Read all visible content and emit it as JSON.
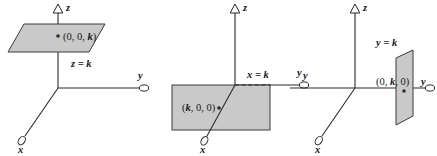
{
  "figure": {
    "background_color": "#ffffff",
    "plane_fill_color": "#c9c9c9",
    "line_color": "#2b2b2b",
    "width": 437,
    "height": 156
  },
  "panels": [
    {
      "id": "panel-z-equals-k",
      "plane_equation": "z = k",
      "point_label": "(0, 0, k)",
      "point_coords": {
        "x": 0,
        "y": 0,
        "z": "k"
      },
      "axes": [
        {
          "name": "z",
          "label": "z",
          "direction": "up"
        },
        {
          "name": "y",
          "label": "y",
          "direction": "right"
        },
        {
          "name": "x",
          "label": "x",
          "direction": "down-left"
        }
      ],
      "plane_orientation": "horizontal",
      "description": "Horizontal plane parallel to the xy-plane at height k"
    },
    {
      "id": "panel-x-equals-k",
      "plane_equation": "x = k",
      "point_label": "(k, 0, 0)",
      "point_coords": {
        "x": "k",
        "y": 0,
        "z": 0
      },
      "axes": [
        {
          "name": "z",
          "label": "z",
          "direction": "up"
        },
        {
          "name": "y",
          "label": "y",
          "direction": "right"
        },
        {
          "name": "x",
          "label": "x",
          "direction": "down-left"
        }
      ],
      "plane_orientation": "vertical-facing-x",
      "description": "Vertical plane parallel to the yz-plane at x = k"
    },
    {
      "id": "panel-y-equals-k",
      "plane_equation": "y = k",
      "point_label": "(0, k, 0)",
      "point_coords": {
        "x": 0,
        "y": "k",
        "z": 0
      },
      "axes": [
        {
          "name": "z",
          "label": "z",
          "direction": "up"
        },
        {
          "name": "y",
          "label": "y",
          "direction": "right"
        },
        {
          "name": "x",
          "label": "x",
          "direction": "down-left"
        }
      ],
      "plane_orientation": "vertical-facing-y",
      "description": "Vertical plane parallel to the xz-plane at y = k"
    }
  ]
}
